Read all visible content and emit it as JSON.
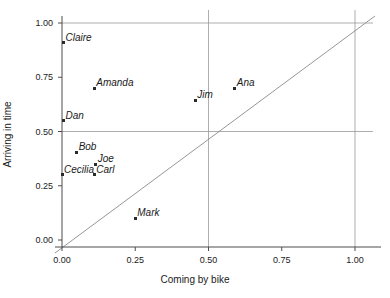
{
  "chart_data": {
    "type": "scatter",
    "title": "",
    "xlabel": "Coming by bike",
    "ylabel": "Arriving in time",
    "xlim": [
      -0.06,
      1.06
    ],
    "ylim": [
      -0.06,
      1.06
    ],
    "xticks": [
      "0.00",
      "0.25",
      "0.50",
      "0.75",
      "1.00"
    ],
    "xtick_values": [
      0.0,
      0.25,
      0.5,
      0.75,
      1.0
    ],
    "yticks": [
      "0.00",
      "0.25",
      "0.50",
      "0.75",
      "1.00"
    ],
    "ytick_values": [
      0.0,
      0.25,
      0.5,
      0.75,
      1.0
    ],
    "grid": true,
    "gridlines_x": [
      0.5,
      1.0
    ],
    "gridlines_y": [
      0.5,
      1.0
    ],
    "grid_color": "#999999",
    "marker_color": "#2b2b2b",
    "reference_line": {
      "name": "identity-line",
      "from": [
        -0.06,
        -0.06
      ],
      "to": [
        1.06,
        1.06
      ],
      "color": "#8a8a8a"
    },
    "legend": null,
    "points": [
      {
        "label": "Claire",
        "x": 0.005,
        "y": 0.91
      },
      {
        "label": "Amanda",
        "x": 0.11,
        "y": 0.7
      },
      {
        "label": "Ana",
        "x": 0.59,
        "y": 0.7
      },
      {
        "label": "Jim",
        "x": 0.455,
        "y": 0.645
      },
      {
        "label": "Dan",
        "x": 0.005,
        "y": 0.55
      },
      {
        "label": "Bob",
        "x": 0.05,
        "y": 0.405
      },
      {
        "label": "Joe",
        "x": 0.115,
        "y": 0.35
      },
      {
        "label": "Cecilia",
        "x": 0.0,
        "y": 0.3
      },
      {
        "label": "Carl",
        "x": 0.11,
        "y": 0.3
      },
      {
        "label": "Mark",
        "x": 0.25,
        "y": 0.1
      }
    ]
  }
}
